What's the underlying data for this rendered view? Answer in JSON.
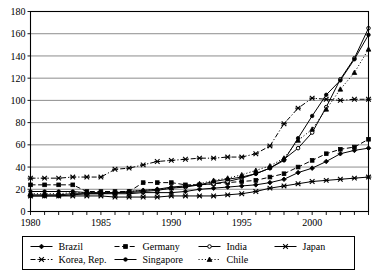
{
  "chart_data": {
    "type": "line",
    "title": "",
    "subtitle": "",
    "xlabel": "",
    "ylabel": "",
    "xlim": [
      1980,
      2004
    ],
    "ylim": [
      0,
      180
    ],
    "ytick_step": 20,
    "yticks": [
      0,
      20,
      40,
      60,
      80,
      100,
      120,
      140,
      160,
      180
    ],
    "xticks_labeled": [
      1980,
      1985,
      1990,
      1995,
      2000
    ],
    "xticks_all": [
      1980,
      1981,
      1982,
      1983,
      1984,
      1985,
      1986,
      1987,
      1988,
      1989,
      1990,
      1991,
      1992,
      1993,
      1994,
      1995,
      1996,
      1997,
      1998,
      1999,
      2000,
      2001,
      2002,
      2003,
      2004
    ],
    "grid": "horizontal",
    "legend_position": "bottom",
    "colors": {
      "ink": "#000000",
      "grid": "#808080",
      "background": "#ffffff"
    },
    "x": [
      1980,
      1981,
      1982,
      1983,
      1984,
      1985,
      1986,
      1987,
      1988,
      1989,
      1990,
      1991,
      1992,
      1993,
      1994,
      1995,
      1996,
      1997,
      1998,
      1999,
      2000,
      2001,
      2002,
      2003,
      2004
    ],
    "series": [
      {
        "name": "Brazil",
        "marker": "diamond",
        "dash": "solid",
        "values": [
          14,
          14,
          14,
          15,
          16,
          16,
          16,
          16,
          17,
          17,
          17,
          18,
          20,
          21,
          22,
          23,
          24,
          26,
          29,
          35,
          39,
          45,
          52,
          55,
          57
        ]
      },
      {
        "name": "Germany",
        "marker": "square",
        "dash": "dashed",
        "values": [
          24,
          24,
          24,
          24,
          18,
          18,
          18,
          18,
          26,
          26,
          26,
          24,
          24,
          25,
          26,
          27,
          28,
          31,
          34,
          40,
          46,
          52,
          56,
          58,
          65
        ]
      },
      {
        "name": "India",
        "marker": "circle-open",
        "dash": "solid",
        "values": [
          15,
          15,
          15,
          16,
          16,
          16,
          17,
          17,
          18,
          19,
          21,
          22,
          24,
          25,
          27,
          30,
          34,
          39,
          47,
          57,
          71,
          94,
          119,
          138,
          165
        ]
      },
      {
        "name": "Japan",
        "marker": "asterisk",
        "dash": "solid",
        "values": [
          14,
          14,
          14,
          14,
          14,
          14,
          13,
          13,
          13,
          13,
          14,
          14,
          14,
          14,
          15,
          16,
          18,
          21,
          23,
          25,
          27,
          28,
          29,
          30,
          31
        ]
      },
      {
        "name": "Korea, Rep.",
        "marker": "asterisk",
        "dash": "dashdot",
        "values": [
          30,
          30,
          30,
          31,
          31,
          31,
          38,
          39,
          42,
          45,
          46,
          47,
          48,
          48,
          49,
          49,
          52,
          59,
          79,
          93,
          102,
          101,
          100,
          101,
          101
        ]
      },
      {
        "name": "Singapore",
        "marker": "circle-filled",
        "dash": "solid",
        "values": [
          18,
          18,
          18,
          18,
          17,
          17,
          17,
          18,
          19,
          20,
          22,
          23,
          24,
          27,
          29,
          31,
          34,
          39,
          46,
          66,
          86,
          105,
          118,
          137,
          159
        ]
      },
      {
        "name": "Chile",
        "marker": "triangle",
        "dash": "dotted",
        "values": [
          16,
          16,
          16,
          17,
          17,
          17,
          17,
          18,
          19,
          20,
          21,
          23,
          25,
          28,
          30,
          33,
          37,
          41,
          48,
          64,
          74,
          92,
          110,
          125,
          146
        ]
      }
    ]
  },
  "legend": {
    "entries": [
      {
        "label": "Brazil"
      },
      {
        "label": "Germany"
      },
      {
        "label": "India"
      },
      {
        "label": "Japan"
      },
      {
        "label": "Korea, Rep."
      },
      {
        "label": "Singapore"
      },
      {
        "label": "Chile"
      }
    ]
  }
}
